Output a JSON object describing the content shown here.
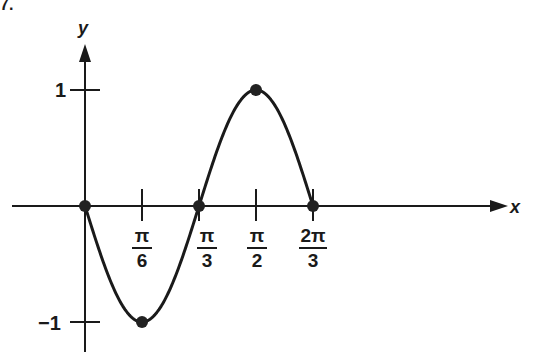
{
  "corner_mark": "7.",
  "chart_data": {
    "type": "line",
    "title": "",
    "function": "y = -sin(3x)",
    "xlabel": "x",
    "ylabel": "y",
    "x_ticks": [
      {
        "value": 0.5236,
        "num": "π",
        "den": "6"
      },
      {
        "value": 1.0472,
        "num": "π",
        "den": "3"
      },
      {
        "value": 1.5708,
        "num": "π",
        "den": "2"
      },
      {
        "value": 2.0944,
        "num": "2π",
        "den": "3"
      }
    ],
    "y_ticks": [
      {
        "value": 1,
        "label": "1"
      },
      {
        "value": -1,
        "label": "−1"
      }
    ],
    "key_points": [
      {
        "x": 0,
        "y": 0
      },
      {
        "x": 0.5236,
        "y": -1
      },
      {
        "x": 1.0472,
        "y": 0
      },
      {
        "x": 1.5708,
        "y": 1
      },
      {
        "x": 2.0944,
        "y": 0
      }
    ],
    "x": [
      0,
      0.5236,
      1.0472,
      1.5708,
      2.0944
    ],
    "series": [
      {
        "name": "y = -sin(3x)",
        "values": [
          0,
          -1,
          0,
          1,
          0
        ]
      }
    ],
    "xlim": [
      0,
      2.0944
    ],
    "ylim": [
      -1,
      1
    ],
    "grid": false,
    "legend": false,
    "colors": {
      "curve": "#1a1a1a",
      "axes": "#1a1a1a"
    }
  }
}
